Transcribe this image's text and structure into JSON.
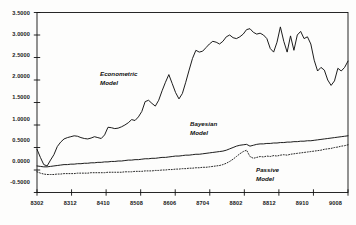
{
  "chart_data": {
    "type": "line",
    "title": "",
    "xlabel": "",
    "ylabel": "",
    "ylim": [
      -0.5,
      3.5
    ],
    "ytick_values": [
      3.5,
      3.0,
      2.5,
      2.0,
      1.5,
      1.0,
      0.5,
      0.0,
      -0.5
    ],
    "ytick_labels": [
      "3.5000",
      "3.0000",
      "2.5000",
      "2.0000",
      "1.5000",
      "1.0000",
      "0.5000",
      "0.0000",
      "-0.5000"
    ],
    "xtick_labels": [
      "8302",
      "8312",
      "8410",
      "8508",
      "8606",
      "8704",
      "8802",
      "8812",
      "8910",
      "9008"
    ],
    "xlim": [
      0,
      90
    ],
    "grid": false,
    "legend_position": "inline-annotations",
    "annotations": [
      {
        "text_line1": "Econometric",
        "text_line2": "Model",
        "x": 23,
        "y": 2.02
      },
      {
        "text_line1": "Bayesian",
        "text_line2": "Model",
        "x": 54,
        "y": 0.82
      },
      {
        "text_line1": "Passive",
        "text_line2": "Model",
        "x": 73,
        "y": 0.22
      }
    ],
    "series": [
      {
        "name": "Econometric Model",
        "style": "solid",
        "color": "#111111",
        "values": [
          0.46,
          0.28,
          0.12,
          0.09,
          0.22,
          0.34,
          0.52,
          0.62,
          0.69,
          0.72,
          0.74,
          0.76,
          0.75,
          0.72,
          0.7,
          0.69,
          0.71,
          0.74,
          0.72,
          0.7,
          0.78,
          0.95,
          0.94,
          0.92,
          0.93,
          0.96,
          1.0,
          1.05,
          1.12,
          1.1,
          1.18,
          1.3,
          1.52,
          1.55,
          1.48,
          1.42,
          1.55,
          1.76,
          1.95,
          2.12,
          1.92,
          1.72,
          1.58,
          1.7,
          1.95,
          2.22,
          2.48,
          2.66,
          2.62,
          2.64,
          2.72,
          2.8,
          2.86,
          2.84,
          2.8,
          2.86,
          2.96,
          3.0,
          2.94,
          2.92,
          2.96,
          3.02,
          3.12,
          3.14,
          3.06,
          3.02,
          3.04,
          3.0,
          2.92,
          2.7,
          2.62,
          2.84,
          3.18,
          2.86,
          2.62,
          2.98,
          2.66,
          3.0,
          3.08,
          2.92,
          2.96,
          2.8,
          2.44,
          2.2,
          2.28,
          2.22,
          2.0,
          1.88,
          1.98,
          2.26,
          2.2,
          2.28,
          2.42
        ]
      },
      {
        "name": "Bayesian Model",
        "style": "solid",
        "color": "#111111",
        "values": [
          0.09,
          0.08,
          0.07,
          0.07,
          0.08,
          0.09,
          0.1,
          0.11,
          0.12,
          0.12,
          0.13,
          0.13,
          0.14,
          0.14,
          0.15,
          0.15,
          0.16,
          0.16,
          0.17,
          0.17,
          0.18,
          0.18,
          0.19,
          0.19,
          0.2,
          0.2,
          0.21,
          0.22,
          0.22,
          0.23,
          0.23,
          0.24,
          0.25,
          0.25,
          0.26,
          0.26,
          0.27,
          0.28,
          0.28,
          0.29,
          0.3,
          0.31,
          0.31,
          0.32,
          0.33,
          0.33,
          0.34,
          0.35,
          0.35,
          0.36,
          0.37,
          0.38,
          0.39,
          0.4,
          0.41,
          0.42,
          0.44,
          0.47,
          0.5,
          0.53,
          0.55,
          0.56,
          0.57,
          0.53,
          0.55,
          0.57,
          0.58,
          0.58,
          0.59,
          0.59,
          0.6,
          0.6,
          0.61,
          0.61,
          0.62,
          0.62,
          0.63,
          0.63,
          0.64,
          0.64,
          0.65,
          0.65,
          0.66,
          0.67,
          0.68,
          0.69,
          0.7,
          0.71,
          0.72,
          0.73,
          0.74,
          0.75,
          0.76
        ]
      },
      {
        "name": "Passive Model",
        "style": "dotted",
        "color": "#111111",
        "values": [
          -0.04,
          -0.07,
          -0.09,
          -0.1,
          -0.1,
          -0.1,
          -0.09,
          -0.09,
          -0.08,
          -0.08,
          -0.08,
          -0.08,
          -0.07,
          -0.07,
          -0.07,
          -0.07,
          -0.06,
          -0.06,
          -0.06,
          -0.06,
          -0.06,
          -0.05,
          -0.05,
          -0.05,
          -0.05,
          -0.05,
          -0.04,
          -0.04,
          -0.04,
          -0.03,
          -0.03,
          -0.03,
          -0.02,
          -0.02,
          -0.02,
          -0.01,
          -0.01,
          0.0,
          0.0,
          0.01,
          0.01,
          0.02,
          0.02,
          0.03,
          0.03,
          0.04,
          0.04,
          0.05,
          0.05,
          0.06,
          0.06,
          0.07,
          0.08,
          0.09,
          0.1,
          0.12,
          0.15,
          0.19,
          0.24,
          0.3,
          0.36,
          0.41,
          0.44,
          0.3,
          0.26,
          0.28,
          0.3,
          0.29,
          0.31,
          0.3,
          0.32,
          0.31,
          0.33,
          0.34,
          0.33,
          0.35,
          0.36,
          0.37,
          0.38,
          0.39,
          0.4,
          0.41,
          0.42,
          0.43,
          0.44,
          0.46,
          0.47,
          0.48,
          0.5,
          0.51,
          0.53,
          0.54,
          0.56
        ]
      }
    ]
  }
}
